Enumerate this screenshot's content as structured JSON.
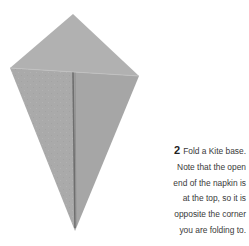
{
  "figure": {
    "colors": {
      "paper": "#a9a9a9",
      "paper_light": "#b4b4b4",
      "crease": "#6e6e6e",
      "background": "#ffffff"
    }
  },
  "caption": {
    "step_number": "2",
    "lines": [
      "Fold a Kite base.",
      "Note that the open",
      "end of the napkin is",
      "at the top, so it is",
      "opposite the corner",
      "you are folding to."
    ]
  }
}
